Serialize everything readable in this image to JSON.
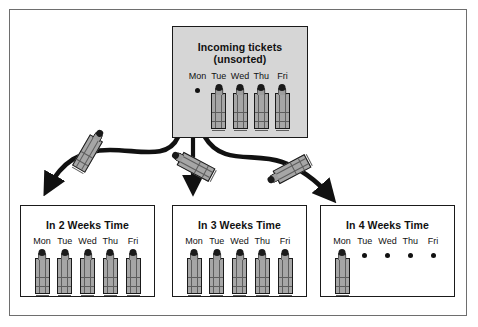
{
  "diagram": {
    "title_visible": false,
    "colors": {
      "incoming_box_fill": "#d6d6d6",
      "week_box_fill": "#ffffff",
      "stroke": "#1a1a1a",
      "ticket_fill": "#a6a6a6",
      "frame": "#6e6e6e"
    },
    "incoming": {
      "title": "Incoming tickets\n(unsorted)",
      "days": [
        {
          "label": "Mon",
          "content": "dot"
        },
        {
          "label": "Tue",
          "content": "stack"
        },
        {
          "label": "Wed",
          "content": "stack"
        },
        {
          "label": "Thu",
          "content": "stack"
        },
        {
          "label": "Fri",
          "content": "stack"
        }
      ]
    },
    "weeks": [
      {
        "title": "In 2 Weeks Time",
        "days": [
          {
            "label": "Mon",
            "content": "stack"
          },
          {
            "label": "Tue",
            "content": "stack"
          },
          {
            "label": "Wed",
            "content": "stack"
          },
          {
            "label": "Thu",
            "content": "stack"
          },
          {
            "label": "Fri",
            "content": "stack"
          }
        ]
      },
      {
        "title": "In 3 Weeks Time",
        "days": [
          {
            "label": "Mon",
            "content": "stack"
          },
          {
            "label": "Tue",
            "content": "stack"
          },
          {
            "label": "Wed",
            "content": "stack"
          },
          {
            "label": "Thu",
            "content": "stack"
          },
          {
            "label": "Fri",
            "content": "stack"
          }
        ]
      },
      {
        "title": "In 4 Weeks Time",
        "days": [
          {
            "label": "Mon",
            "content": "stack"
          },
          {
            "label": "Tue",
            "content": "dot"
          },
          {
            "label": "Wed",
            "content": "dot"
          },
          {
            "label": "Thu",
            "content": "dot"
          },
          {
            "label": "Fri",
            "content": "dot"
          }
        ]
      }
    ],
    "flows": [
      {
        "from": "incoming",
        "to": "In 2 Weeks Time",
        "shape": "curve-left"
      },
      {
        "from": "incoming",
        "to": "In 3 Weeks Time",
        "shape": "straight-down"
      },
      {
        "from": "incoming",
        "to": "In 4 Weeks Time",
        "shape": "curve-right"
      }
    ]
  }
}
